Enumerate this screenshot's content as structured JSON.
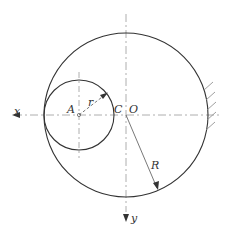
{
  "diagram": {
    "labels": {
      "x_axis": "x",
      "y_axis": "y",
      "point_a": "A",
      "point_c": "C",
      "point_o": "O",
      "small_radius": "r",
      "large_radius": "R"
    },
    "colors": {
      "stroke": "#333333",
      "dash": "#999999"
    }
  }
}
